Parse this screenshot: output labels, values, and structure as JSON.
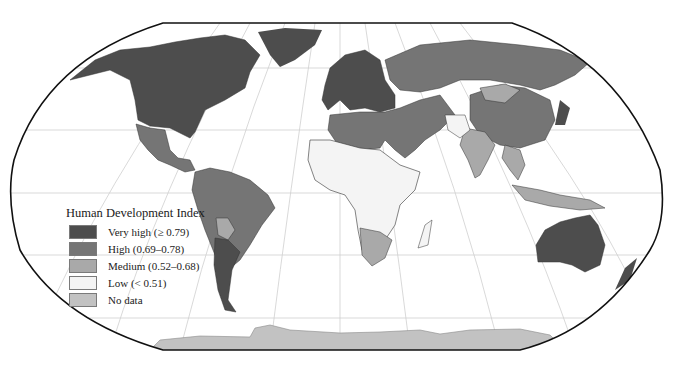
{
  "map": {
    "title": "Human Development Index",
    "projection": "Robinson",
    "colors": {
      "very_high": "#4d4d4d",
      "high": "#757575",
      "medium": "#a9a9a9",
      "low": "#f4f4f4",
      "no_data": "#c2c2c2",
      "ocean": "#ffffff",
      "graticule": "#cfcfcf",
      "outline": "#111111"
    }
  },
  "legend": {
    "title": "Human Development Index",
    "items": [
      {
        "label": "Very high (≥ 0.79)",
        "color": "#4d4d4d"
      },
      {
        "label": "High (0.69–0.78)",
        "color": "#757575"
      },
      {
        "label": "Medium (0.52–0.68)",
        "color": "#a9a9a9"
      },
      {
        "label": "Low (< 0.51)",
        "color": "#f4f4f4"
      },
      {
        "label": "No data",
        "color": "#c2c2c2"
      }
    ]
  }
}
